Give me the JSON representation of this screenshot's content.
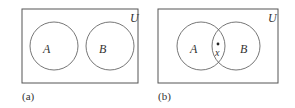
{
  "diagram": {
    "type": "venn",
    "panels": [
      {
        "caption": "(a)",
        "universe_label": "U",
        "sets": [
          {
            "label": "A"
          },
          {
            "label": "B"
          }
        ],
        "relationship": "disjoint"
      },
      {
        "caption": "(b)",
        "universe_label": "U",
        "sets": [
          {
            "label": "A"
          },
          {
            "label": "B"
          }
        ],
        "relationship": "overlapping",
        "point_label": "x"
      }
    ],
    "colors": {
      "stroke": "#555555",
      "text": "#333333",
      "background": "#ffffff"
    }
  }
}
